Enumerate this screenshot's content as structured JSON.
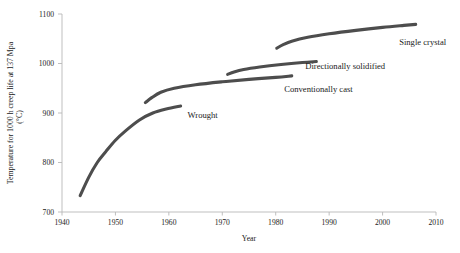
{
  "chart_data": {
    "type": "line",
    "title": "",
    "xlabel": "Year",
    "ylabel": "Temperature for 1000 h creep life at 137 Mpa (°C)",
    "ylabel_main": "Temperature for 1000 h creep life at 137 Mpa",
    "ylabel_unit": "(°C)",
    "xlim": [
      1940,
      2010
    ],
    "ylim": [
      700,
      1100
    ],
    "xticks": [
      1940,
      1950,
      1960,
      1970,
      1980,
      1990,
      2000,
      2010
    ],
    "yticks": [
      700,
      800,
      900,
      1000,
      1100
    ],
    "xtick_labels": [
      "1940",
      "1950",
      "1960",
      "1970",
      "1980",
      "1990",
      "2000",
      "2010"
    ],
    "ytick_labels": [
      "700",
      "800",
      "900",
      "1000",
      "1100"
    ],
    "grid": false,
    "legend": "inline-annotations",
    "line_color": "#4d4d4d",
    "axis_color": "#b8b8b8",
    "series": [
      {
        "name": "Wrought",
        "label": "Wrought",
        "label_x": 1963.5,
        "label_y": 890,
        "x": [
          1943.4,
          1945.0,
          1946.6,
          1948.2,
          1950.0,
          1952.0,
          1954.5,
          1957.0,
          1959.5,
          1962.2
        ],
        "y": [
          733,
          770,
          800,
          822,
          845,
          865,
          886,
          900,
          908,
          914
        ]
      },
      {
        "name": "Conventionally cast",
        "label": "Conventionally  cast",
        "label_x": 1988.0,
        "label_y": 942,
        "x": [
          1955.6,
          1956.8,
          1958.5,
          1961.0,
          1965.0,
          1970.0,
          1975.0,
          1980.0,
          1983.0
        ],
        "y": [
          921,
          931,
          942,
          950,
          957,
          963,
          968,
          972,
          975
        ]
      },
      {
        "name": "Directionally solidified",
        "label": "Directionally solidified",
        "label_x": 1993.0,
        "label_y": 988,
        "x": [
          1971.0,
          1972.2,
          1974.0,
          1977.0,
          1981.0,
          1985.0,
          1987.6
        ],
        "y": [
          978,
          983,
          988,
          993,
          998,
          1002,
          1004
        ]
      },
      {
        "name": "Single crystal",
        "label": "Single crystal",
        "label_x": 2007.5,
        "label_y": 1037,
        "x": [
          1980.2,
          1981.4,
          1983.0,
          1986.0,
          1990.0,
          1995.0,
          2000.0,
          2004.0,
          2006.2
        ],
        "y": [
          1031,
          1038,
          1045,
          1053,
          1060,
          1067,
          1073,
          1077,
          1079
        ]
      }
    ]
  }
}
